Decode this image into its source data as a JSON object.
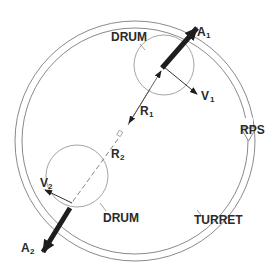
{
  "diagram": {
    "labels": {
      "drum_top": "DRUM",
      "drum_bottom": "DRUM",
      "turret": "TURRET",
      "rps": "RPS",
      "a1_main": "A",
      "a1_sub": "1",
      "a2_main": "A",
      "a2_sub": "2",
      "v1_main": "V",
      "v1_sub": "1",
      "v2_main": "V",
      "v2_sub": "2",
      "r1_main": "R",
      "r1_sub": "1",
      "r2_main": "R",
      "r2_sub": "2"
    },
    "colors": {
      "line": "#8a8a8a",
      "arrow": "#1e1e1e",
      "text": "#2a2a2a",
      "background": "#ffffff"
    }
  }
}
